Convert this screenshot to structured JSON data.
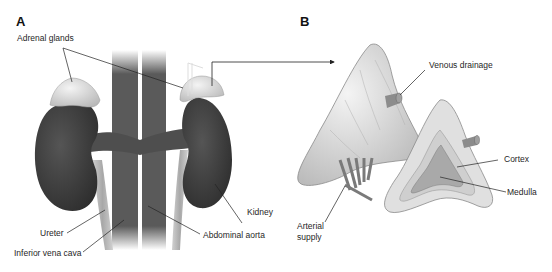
{
  "figure": {
    "panels": [
      {
        "id": "A",
        "label": "A",
        "title": "Kidneys and adrenal glands (anterior view)",
        "annotations": [
          {
            "key": "adrenal_glands",
            "text": "Adrenal glands"
          },
          {
            "key": "kidney",
            "text": "Kidney"
          },
          {
            "key": "ureter",
            "text": "Ureter"
          },
          {
            "key": "abdominal_aorta",
            "text": "Abdominal aorta"
          },
          {
            "key": "inferior_vena_cava",
            "text": "Inferior vena cava"
          }
        ]
      },
      {
        "id": "B",
        "label": "B",
        "title": "Adrenal gland detail with cross-section",
        "annotations": [
          {
            "key": "venous_drainage",
            "text": "Venous drainage"
          },
          {
            "key": "cortex",
            "text": "Cortex"
          },
          {
            "key": "medulla",
            "text": "Medulla"
          },
          {
            "key": "arterial_supply",
            "text": "Arterial supply",
            "lines": [
              "Arterial",
              "supply"
            ]
          }
        ]
      }
    ],
    "colors": {
      "kidney": "#3e3e3e",
      "adrenal": "#cfcfcf",
      "vessel": "#5a5a5a",
      "ureter": "#b9b9b9",
      "gland_detail": "#dadada",
      "text": "#1f1f1f",
      "leader_line": "#222222"
    }
  }
}
